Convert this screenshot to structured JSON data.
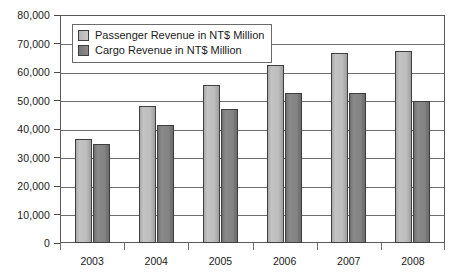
{
  "chart_data": {
    "type": "bar",
    "title": "",
    "subtitle": "",
    "xlabel": "",
    "ylabel": "",
    "categories": [
      "2003",
      "2004",
      "2005",
      "2006",
      "2007",
      "2008"
    ],
    "series": [
      {
        "name": "Passenger Revenue in NT$ Million",
        "color": "#bdbdbd",
        "values": [
          36500,
          48200,
          55500,
          62600,
          66500,
          67500
        ]
      },
      {
        "name": "Cargo Revenue in NT$ Million",
        "color": "#808080",
        "values": [
          34800,
          41500,
          47000,
          52500,
          52800,
          49800
        ]
      }
    ],
    "ylim": [
      0,
      80000
    ],
    "ytick_step": 10000,
    "ytick_labels": [
      "0",
      "10,000",
      "20,000",
      "30,000",
      "40,000",
      "50,000",
      "60,000",
      "70,000",
      "80,000"
    ],
    "ytick_values": [
      0,
      10000,
      20000,
      30000,
      40000,
      50000,
      60000,
      70000,
      80000
    ],
    "grid": true,
    "grid_axis": "y",
    "legend_position": "top-left-inside",
    "legend": [
      "Passenger Revenue in NT$ Million",
      "Cargo Revenue in NT$ Million"
    ],
    "annotations": []
  }
}
